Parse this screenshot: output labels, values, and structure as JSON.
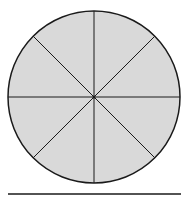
{
  "diagram": {
    "shape": "circle",
    "segments": 8,
    "fill_color": "#d9d9d9",
    "stroke_color": "#1a1a1a",
    "center": [
      94,
      97
    ],
    "radius": 86,
    "divider_angles_deg": [
      0,
      45,
      90,
      135
    ],
    "baseline": {
      "x1": 8,
      "x2": 181,
      "y": 194
    }
  }
}
